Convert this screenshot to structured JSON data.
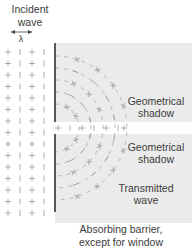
{
  "labels": {
    "incident_line1": "Incident",
    "incident_line2": "wave",
    "wavelength_symbol": "λ",
    "shadow_top_line1": "Geometrical",
    "shadow_top_line2": "shadow",
    "shadow_bottom_line1": "Geometrical",
    "shadow_bottom_line2": "shadow",
    "transmitted_line1": "Transmitted",
    "transmitted_line2": "wave",
    "barrier_line1": "Absorbing barrier,",
    "barrier_line2": "except for window"
  },
  "colors": {
    "shadow_fill": "#ebebeb",
    "barrier": "#333333",
    "wave_marks": "#9a9a9a",
    "text": "#3c3c3c"
  }
}
